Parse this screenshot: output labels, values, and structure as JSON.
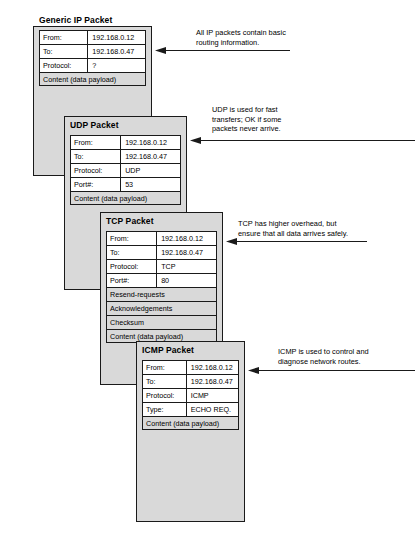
{
  "diagram": {
    "ip_address_from": "192.168.0.12",
    "ip_address_to": "192.168.0.47"
  },
  "packets": [
    {
      "id": "generic-ip",
      "title": "Generic IP Packet",
      "rows": [
        {
          "label": "From:",
          "value": "192.168.0.12",
          "full": false,
          "shaded": false
        },
        {
          "label": "To:",
          "value": "192.168.0.47",
          "full": false,
          "shaded": false
        },
        {
          "label": "Protocol:",
          "value": "?",
          "full": false,
          "shaded": false
        },
        {
          "label": "Content (data payload)",
          "value": "",
          "full": true,
          "shaded": true
        }
      ]
    },
    {
      "id": "udp",
      "title": "UDP Packet",
      "rows": [
        {
          "label": "From:",
          "value": "192.168.0.12",
          "full": false,
          "shaded": false
        },
        {
          "label": "To:",
          "value": "192.168.0.47",
          "full": false,
          "shaded": false
        },
        {
          "label": "Protocol:",
          "value": "UDP",
          "full": false,
          "shaded": false
        },
        {
          "label": "Port#:",
          "value": "53",
          "full": false,
          "shaded": false
        },
        {
          "label": "Content (data payload)",
          "value": "",
          "full": true,
          "shaded": true
        }
      ]
    },
    {
      "id": "tcp",
      "title": "TCP Packet",
      "rows": [
        {
          "label": "From:",
          "value": "192.168.0.12",
          "full": false,
          "shaded": false
        },
        {
          "label": "To:",
          "value": "192.168.0.47",
          "full": false,
          "shaded": false
        },
        {
          "label": "Protocol:",
          "value": "TCP",
          "full": false,
          "shaded": false
        },
        {
          "label": "Port#:",
          "value": "80",
          "full": false,
          "shaded": false
        },
        {
          "label": "Resend-requests",
          "value": "",
          "full": true,
          "shaded": true
        },
        {
          "label": "Acknowledgements",
          "value": "",
          "full": true,
          "shaded": true
        },
        {
          "label": "Checksum",
          "value": "",
          "full": true,
          "shaded": true
        },
        {
          "label": "Content (data payload)",
          "value": "",
          "full": true,
          "shaded": true
        }
      ]
    },
    {
      "id": "icmp",
      "title": "ICMP Packet",
      "rows": [
        {
          "label": "From:",
          "value": "192.168.0.12",
          "full": false,
          "shaded": false
        },
        {
          "label": "To:",
          "value": "192.168.0.47",
          "full": false,
          "shaded": false
        },
        {
          "label": "Protocol:",
          "value": "ICMP",
          "full": false,
          "shaded": false
        },
        {
          "label": "Type:",
          "value": "ECHO REQ.",
          "full": false,
          "shaded": false
        },
        {
          "label": "Content (data payload)",
          "value": "",
          "full": true,
          "shaded": true
        }
      ]
    }
  ],
  "annotations": [
    {
      "id": "note-ip",
      "text": "All IP packets contain basic\nrouting information."
    },
    {
      "id": "note-udp",
      "text": "UDP is used for fast\ntransfers; OK if some\npackets never arrive."
    },
    {
      "id": "note-tcp",
      "text": "TCP has higher overhead, but\nensure that all data arrives safely."
    },
    {
      "id": "note-icmp",
      "text": "ICMP is used to control and\ndiagnose network routes."
    }
  ],
  "colors": {
    "packet_fill": "#d9d9d9",
    "row_fill": "#ffffff",
    "stroke": "#1a1a1a",
    "text": "#000000"
  }
}
